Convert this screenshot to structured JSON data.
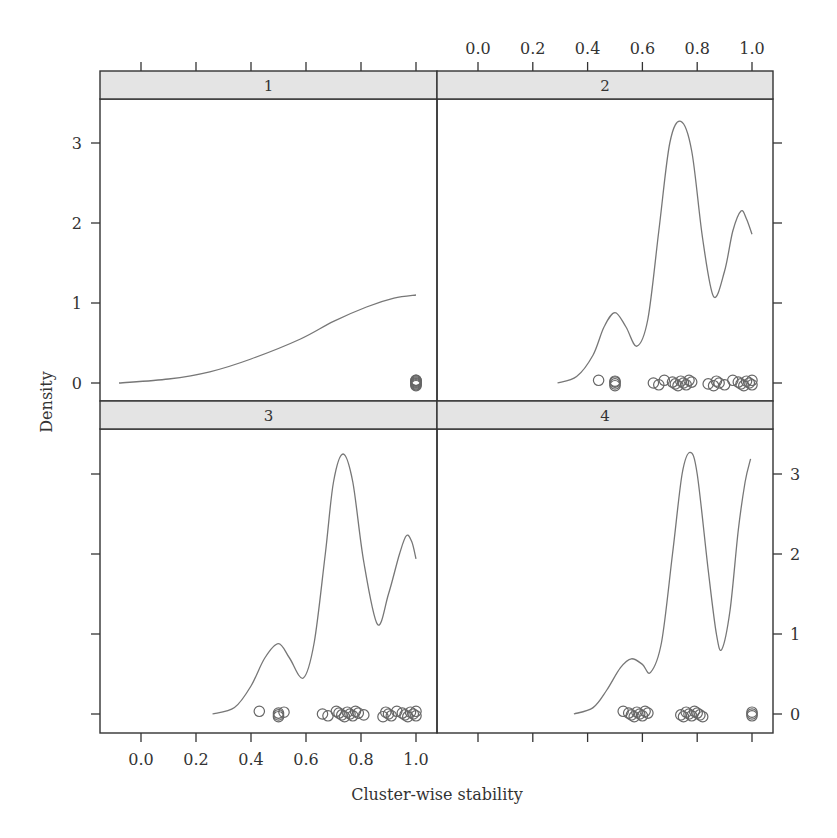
{
  "chart_data": {
    "type": "line",
    "title": "",
    "xlabel": "Cluster-wise stability",
    "ylabel": "Density",
    "xlim": [
      -0.15,
      1.07
    ],
    "ylim": [
      -0.23,
      3.5
    ],
    "x_ticks": [
      "0.0",
      "0.2",
      "0.4",
      "0.6",
      "0.8",
      "1.0"
    ],
    "y_ticks": [
      "0",
      "1",
      "2",
      "3"
    ],
    "grid": false,
    "layout": "2x2 lattice panels (densityplot with rug points)",
    "panels": [
      {
        "strip": "1",
        "curve": {
          "x": [
            -0.08,
            0.1,
            0.25,
            0.4,
            0.58,
            0.7,
            0.82,
            0.92,
            1.0
          ],
          "y": [
            0.0,
            0.05,
            0.14,
            0.3,
            0.55,
            0.77,
            0.95,
            1.06,
            1.1
          ]
        },
        "points": [
          1.0,
          1.0,
          1.0,
          1.0,
          1.0,
          1.0,
          1.0,
          1.0
        ]
      },
      {
        "strip": "2",
        "curve": {
          "x": [
            0.29,
            0.36,
            0.42,
            0.46,
            0.5,
            0.54,
            0.58,
            0.62,
            0.66,
            0.7,
            0.74,
            0.78,
            0.82,
            0.86,
            0.9,
            0.93,
            0.96,
            0.98,
            1.0
          ],
          "y": [
            0.0,
            0.08,
            0.35,
            0.7,
            0.88,
            0.7,
            0.46,
            0.8,
            1.9,
            3.0,
            3.27,
            2.9,
            1.8,
            1.08,
            1.4,
            1.9,
            2.15,
            2.05,
            1.86
          ]
        },
        "points": [
          0.44,
          0.5,
          0.5,
          0.5,
          0.5,
          0.64,
          0.66,
          0.68,
          0.71,
          0.72,
          0.73,
          0.74,
          0.75,
          0.76,
          0.77,
          0.78,
          0.84,
          0.86,
          0.87,
          0.88,
          0.9,
          0.93,
          0.95,
          0.96,
          0.97,
          0.98,
          0.99,
          1.0,
          1.0
        ]
      },
      {
        "strip": "3",
        "curve": {
          "x": [
            0.26,
            0.34,
            0.4,
            0.45,
            0.5,
            0.54,
            0.59,
            0.63,
            0.67,
            0.7,
            0.735,
            0.77,
            0.81,
            0.86,
            0.9,
            0.94,
            0.965,
            0.985,
            1.0
          ],
          "y": [
            0.0,
            0.08,
            0.35,
            0.7,
            0.88,
            0.7,
            0.45,
            0.9,
            2.0,
            2.9,
            3.25,
            2.9,
            1.9,
            1.12,
            1.5,
            2.0,
            2.23,
            2.15,
            1.94
          ]
        },
        "points": [
          0.43,
          0.5,
          0.5,
          0.5,
          0.52,
          0.66,
          0.68,
          0.71,
          0.72,
          0.73,
          0.74,
          0.75,
          0.76,
          0.77,
          0.78,
          0.79,
          0.81,
          0.88,
          0.89,
          0.9,
          0.91,
          0.93,
          0.95,
          0.96,
          0.97,
          0.98,
          0.99,
          1.0,
          1.0
        ]
      },
      {
        "strip": "4",
        "curve": {
          "x": [
            0.35,
            0.42,
            0.47,
            0.52,
            0.56,
            0.6,
            0.63,
            0.67,
            0.71,
            0.745,
            0.774,
            0.8,
            0.84,
            0.87,
            0.89,
            0.92,
            0.95,
            0.975,
            0.995
          ],
          "y": [
            0.0,
            0.08,
            0.3,
            0.58,
            0.69,
            0.62,
            0.52,
            0.9,
            2.0,
            3.0,
            3.27,
            3.0,
            1.8,
            1.0,
            0.81,
            1.3,
            2.3,
            2.9,
            3.19
          ]
        },
        "points": [
          0.53,
          0.55,
          0.56,
          0.57,
          0.58,
          0.59,
          0.6,
          0.61,
          0.62,
          0.74,
          0.75,
          0.76,
          0.77,
          0.78,
          0.79,
          0.8,
          0.81,
          0.82,
          1.0,
          1.0,
          1.0
        ]
      }
    ]
  },
  "figure": {
    "xlabel": "Cluster-wise stability",
    "ylabel": "Density",
    "strips": [
      "1",
      "2",
      "3",
      "4"
    ],
    "x_tick_labels": [
      "0.0",
      "0.2",
      "0.4",
      "0.6",
      "0.8",
      "1.0"
    ],
    "y_tick_labels": [
      "0",
      "1",
      "2",
      "3"
    ]
  }
}
